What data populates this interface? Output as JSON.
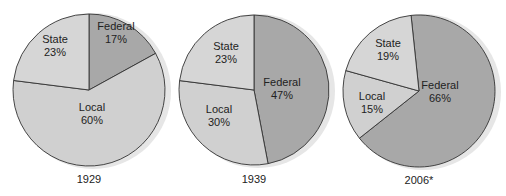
{
  "colors": {
    "state": "#d6d6d6",
    "local": "#d0d0d0",
    "federal": "#a8a8a8",
    "stroke": "#333333",
    "shadow": "#e6e6e6"
  },
  "chart_data": [
    {
      "type": "pie",
      "title": "1929",
      "categories": [
        "Federal",
        "State",
        "Local"
      ],
      "values": [
        17,
        23,
        60
      ],
      "labels": [
        "Federal\n17%",
        "State\n23%",
        "Local\n60%"
      ]
    },
    {
      "type": "pie",
      "title": "1939",
      "categories": [
        "Federal",
        "State",
        "Local"
      ],
      "values": [
        47,
        23,
        30
      ],
      "labels": [
        "Federal\n47%",
        "State\n23%",
        "Local\n30%"
      ]
    },
    {
      "type": "pie",
      "title": "2006*",
      "categories": [
        "Federal",
        "State",
        "Local"
      ],
      "values": [
        66,
        19,
        15
      ],
      "labels": [
        "Federal\n66%",
        "State\n19%",
        "Local\n15%"
      ]
    }
  ],
  "pies": [
    {
      "year": "1929",
      "slices": [
        {
          "name": "Federal",
          "pct": "17%"
        },
        {
          "name": "State",
          "pct": "23%"
        },
        {
          "name": "Local",
          "pct": "60%"
        }
      ]
    },
    {
      "year": "1939",
      "slices": [
        {
          "name": "Federal",
          "pct": "47%"
        },
        {
          "name": "State",
          "pct": "23%"
        },
        {
          "name": "Local",
          "pct": "30%"
        }
      ]
    },
    {
      "year": "2006*",
      "slices": [
        {
          "name": "Federal",
          "pct": "66%"
        },
        {
          "name": "State",
          "pct": "19%"
        },
        {
          "name": "Local",
          "pct": "15%"
        }
      ]
    }
  ]
}
